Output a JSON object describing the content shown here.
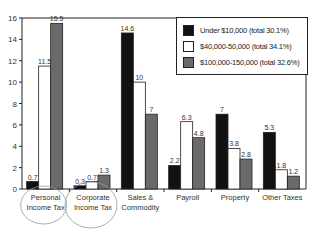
{
  "chart_data": {
    "type": "bar",
    "title": "",
    "xlabel": "",
    "ylabel": "",
    "ylim": [
      0,
      16
    ],
    "yticks": [
      0,
      2,
      4,
      6,
      8,
      10,
      12,
      14,
      16
    ],
    "grid": false,
    "legend_position": "top-right (inside)",
    "categories": [
      "Personal\nIncome Tax",
      "Corporate\nIncome Tax",
      "Sales &\nCommodity",
      "Payroll",
      "Property",
      "Other Taxes"
    ],
    "series": [
      {
        "name": "Under $10,000 (total 30.1%)",
        "color": "#111111",
        "values": [
          0.7,
          0.3,
          14.6,
          2.2,
          7,
          5.3
        ]
      },
      {
        "name": "$40,000-50,000 (total 34.1%)",
        "color": "#ffffff",
        "values": [
          11.5,
          0.7,
          10,
          6.3,
          3.8,
          1.8
        ]
      },
      {
        "name": "$100,000-150,000 (total 32.6%)",
        "color": "#6a6a6a",
        "values": [
          15.5,
          1.3,
          7,
          4.8,
          2.8,
          1.2
        ]
      }
    ],
    "annotations": [
      "Hand-drawn circles around 'Personal Income Tax' and 'Corporate Income Tax' categories"
    ]
  },
  "legend": {
    "items": [
      {
        "label": "Under $10,000 (total 30.1%)",
        "color": "#111111"
      },
      {
        "label": "$40,000-50,000 (total 34.1%)",
        "color": "#ffffff"
      },
      {
        "label": "$100,000-150,000 (total 32.6%)",
        "color": "#6a6a6a"
      }
    ]
  }
}
